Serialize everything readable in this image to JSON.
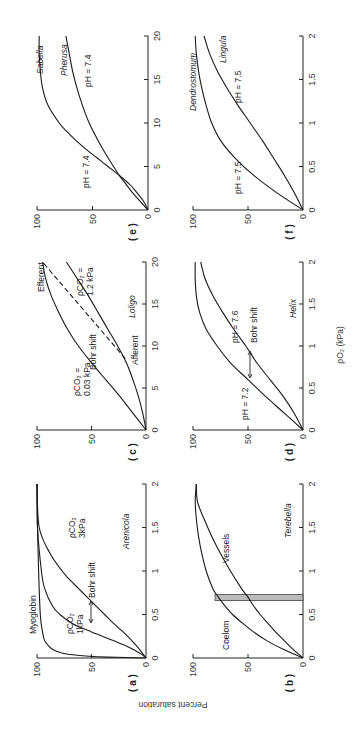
{
  "chart_data": {
    "type": "line",
    "orientation": "figure rotated 90 degrees clockwise",
    "ylabel": "Percent saturation",
    "xlabel": "pO2 (kPa)",
    "panels": [
      {
        "id": "a",
        "label": "( a )",
        "species": "Arenicola",
        "xlim": [
          0,
          2
        ],
        "xticks": [
          "0",
          "0.5",
          "1",
          "1.5",
          "2"
        ],
        "ylim": [
          0,
          100
        ],
        "yticks": [
          "0",
          "50",
          "100"
        ],
        "series": [
          {
            "name": "Myoglobin",
            "x": [
              0,
              0.01,
              0.02,
              0.04,
              0.06,
              0.1,
              0.15,
              0.2,
              0.3,
              0.5,
              1.0,
              1.5,
              2.0
            ],
            "y": [
              0,
              35,
              52,
              70,
              78,
              86,
              90,
              93,
              95,
              97,
              98.5,
              99.5,
              100
            ]
          },
          {
            "name": "pCO2 1kPa",
            "x": [
              0,
              0.05,
              0.1,
              0.15,
              0.2,
              0.25,
              0.3,
              0.35,
              0.4,
              0.5,
              0.6,
              0.8,
              1.0,
              1.5,
              2.0
            ],
            "y": [
              0,
              5,
              12,
              20,
              30,
              40,
              50,
              60,
              68,
              79,
              86,
              93,
              96,
              99.5,
              100
            ]
          },
          {
            "name": "pCO2 3kPa",
            "x": [
              0,
              0.1,
              0.2,
              0.3,
              0.4,
              0.5,
              0.6,
              0.7,
              0.8,
              0.9,
              1.0,
              1.2,
              1.5,
              2.0
            ],
            "y": [
              0,
              6,
              13,
              21,
              30,
              38,
              46,
              54,
              62,
              70,
              77,
              88,
              98,
              100
            ]
          }
        ],
        "annotations": [
          "Myoglobin",
          "pCO2 1kPa",
          "pCO2 3kPa",
          "Bohr shift"
        ]
      },
      {
        "id": "b",
        "label": "( b )",
        "species": "Terebella",
        "xlim": [
          0,
          2
        ],
        "xticks": [
          "0",
          "0.5",
          "1",
          "1.5",
          "2"
        ],
        "ylim": [
          0,
          100
        ],
        "yticks": [
          "0",
          "50",
          "100"
        ],
        "series": [
          {
            "name": "Coelom",
            "x": [
              0,
              0.1,
              0.2,
              0.3,
              0.4,
              0.5,
              0.6,
              0.7,
              0.8,
              1.0,
              1.2,
              1.4,
              1.6,
              1.8,
              2.0
            ],
            "y": [
              0,
              18,
              33,
              45,
              55,
              64,
              71,
              77,
              82,
              88,
              92,
              95,
              97,
              98,
              97
            ]
          },
          {
            "name": "Vessels",
            "x": [
              0,
              0.1,
              0.2,
              0.3,
              0.4,
              0.5,
              0.6,
              0.7,
              0.8,
              1.0,
              1.2,
              1.4,
              1.6,
              1.8,
              2.0
            ],
            "y": [
              0,
              9,
              17,
              25,
              32,
              39,
              45,
              50,
              56,
              66,
              75,
              83,
              90,
              96,
              97
            ]
          }
        ],
        "shaded_band": {
          "x": [
            0.66,
            0.73
          ]
        },
        "annotations": [
          "Coelom",
          "Vessels"
        ]
      },
      {
        "id": "c",
        "label": "( c )",
        "species": "Loligo",
        "xlim": [
          0,
          20
        ],
        "xticks": [
          "0",
          "5",
          "10",
          "15",
          "20"
        ],
        "ylim": [
          0,
          100
        ],
        "yticks": [
          "0",
          "50",
          "100"
        ],
        "series": [
          {
            "name": "pCO2 0.03kPa",
            "x": [
              0,
              2,
              4,
              6,
              8,
              10,
              12,
              14,
              16,
              18,
              20
            ],
            "y": [
              0,
              12,
              24,
              37,
              50,
              62,
              72,
              80,
              87,
              92,
              95
            ]
          },
          {
            "name": "pCO2 1.2kPa",
            "x": [
              0,
              2,
              4,
              6,
              8,
              10,
              12,
              14,
              16,
              18,
              20
            ],
            "y": [
              0,
              3,
              7,
              12,
              18,
              26,
              35,
              44,
              53,
              63,
              73
            ]
          },
          {
            "name": "Afferent-Efferent",
            "style": "dashed",
            "x": [
              8.5,
              20
            ],
            "y": [
              19,
              95
            ]
          }
        ],
        "annotations": [
          "pCO2 = 0.03kPa",
          "pCO2 = 1.2kPa",
          "Bohr shift",
          "Efferent",
          "Afferent"
        ]
      },
      {
        "id": "d",
        "label": "( d )",
        "species": "Helix",
        "xlim": [
          0,
          2
        ],
        "xticks": [
          "0",
          "0.5",
          "1",
          "1.5",
          "2"
        ],
        "ylim": [
          0,
          100
        ],
        "yticks": [
          "0",
          "50",
          "100"
        ],
        "series": [
          {
            "name": "pH = 7.2",
            "x": [
              0,
              0.2,
              0.4,
              0.6,
              0.8,
              1.0,
              1.2,
              1.4,
              1.6,
              1.8,
              2.0
            ],
            "y": [
              0,
              17,
              34,
              50,
              66,
              78,
              88,
              94,
              97,
              98,
              98
            ]
          },
          {
            "name": "pH = 7.6",
            "x": [
              0,
              0.2,
              0.4,
              0.6,
              0.8,
              1.0,
              1.2,
              1.4,
              1.6,
              1.8,
              2.0
            ],
            "y": [
              0,
              8,
              18,
              30,
              42,
              52,
              63,
              73,
              82,
              89,
              93
            ]
          }
        ],
        "annotations": [
          "pH = 7.2",
          "pH = 7.6",
          "Bohr shift"
        ]
      },
      {
        "id": "e",
        "label": "( e )",
        "species": "Sabella",
        "xlim": [
          0,
          20
        ],
        "xticks": [
          "0",
          "5",
          "10",
          "15",
          "20"
        ],
        "ylim": [
          0,
          100
        ],
        "yticks": [
          "0",
          "50",
          "100"
        ],
        "series": [
          {
            "name": "Sabella pH 7.4",
            "x": [
              0,
              1,
              2,
              3,
              4,
              5,
              6,
              7,
              8,
              9,
              10,
              12,
              14,
              16,
              18,
              20
            ],
            "y": [
              0,
              4,
              10,
              17,
              26,
              36,
              46,
              56,
              65,
              73,
              80,
              90,
              95,
              97,
              98,
              98
            ]
          },
          {
            "name": "Pherusa pH 7.4",
            "x": [
              0,
              1,
              2,
              3,
              4,
              6,
              8,
              10,
              12,
              14,
              16,
              18,
              20
            ],
            "y": [
              0,
              7,
              14,
              20,
              26,
              36,
              45,
              53,
              59,
              64,
              68,
              71,
              74
            ]
          }
        ],
        "annotations": [
          "pH = 7.4",
          "pH = 7.4",
          "Sabella",
          "Pherusa"
        ]
      },
      {
        "id": "f",
        "label": "( f )",
        "species": "Dendrostomum / Lingula",
        "xlim": [
          0,
          2
        ],
        "xticks": [
          "0",
          "0.5",
          "1",
          "1.5",
          "2"
        ],
        "ylim": [
          0,
          100
        ],
        "yticks": [
          "0",
          "50",
          "100"
        ],
        "series": [
          {
            "name": "Dendrostomum pH 7.5",
            "x": [
              0,
              0.2,
              0.4,
              0.6,
              0.8,
              1.0,
              1.2,
              1.4,
              1.6,
              1.8,
              2.0
            ],
            "y": [
              0,
              24,
              45,
              62,
              75,
              83,
              88,
              92,
              95,
              97,
              98
            ]
          },
          {
            "name": "Lingula pH 7.5",
            "x": [
              0,
              0.2,
              0.4,
              0.6,
              0.8,
              1.0,
              1.2,
              1.4,
              1.6,
              1.8,
              2.0
            ],
            "y": [
              0,
              8,
              17,
              27,
              37,
              48,
              59,
              69,
              78,
              85,
              90
            ]
          }
        ],
        "annotations": [
          "pH = 7.5",
          "pH = 7.5",
          "Dendrostomum",
          "Lingula"
        ]
      }
    ]
  },
  "labels": {
    "a": {
      "panel": "( a )",
      "species": "Arenicola",
      "myoglobin": "Myoglobin",
      "co2_low_1": "ρCO₂",
      "co2_low_2": "1kPa",
      "co2_high_1": "ρCO₂",
      "co2_high_2": "3kPa",
      "bohr": "Bohr shift"
    },
    "b": {
      "panel": "( b )",
      "species": "Terebella",
      "coelom": "Coelom",
      "vessels": "Vessels"
    },
    "c": {
      "panel": "( c )",
      "species": "Loligo",
      "co2_low_1": "ρCO₂ =",
      "co2_low_2": "0.03 kPa",
      "co2_high_1": "ρCO₂ =",
      "co2_high_2": "1.2 kPa",
      "bohr": "Bohr shift",
      "efferent": "Efferent",
      "afferent": "Afferent"
    },
    "d": {
      "panel": "( d )",
      "species": "Helix",
      "ph_low": "pH = 7.2",
      "ph_high": "pH = 7.6",
      "bohr": "Bohr shift"
    },
    "e": {
      "panel": "( e )",
      "species1": "Sabella",
      "species2": "Pherusa",
      "ph1": "pH = 7.4",
      "ph2": "pH = 7.4"
    },
    "f": {
      "panel": "( f )",
      "species1": "Dendrostomum",
      "species2": "Lingula",
      "ph1": "pH = 7.5",
      "ph2": "pH = 7.5"
    },
    "ylabel": "Percent saturation",
    "xlabel": "ρO₂ (kPa)"
  }
}
